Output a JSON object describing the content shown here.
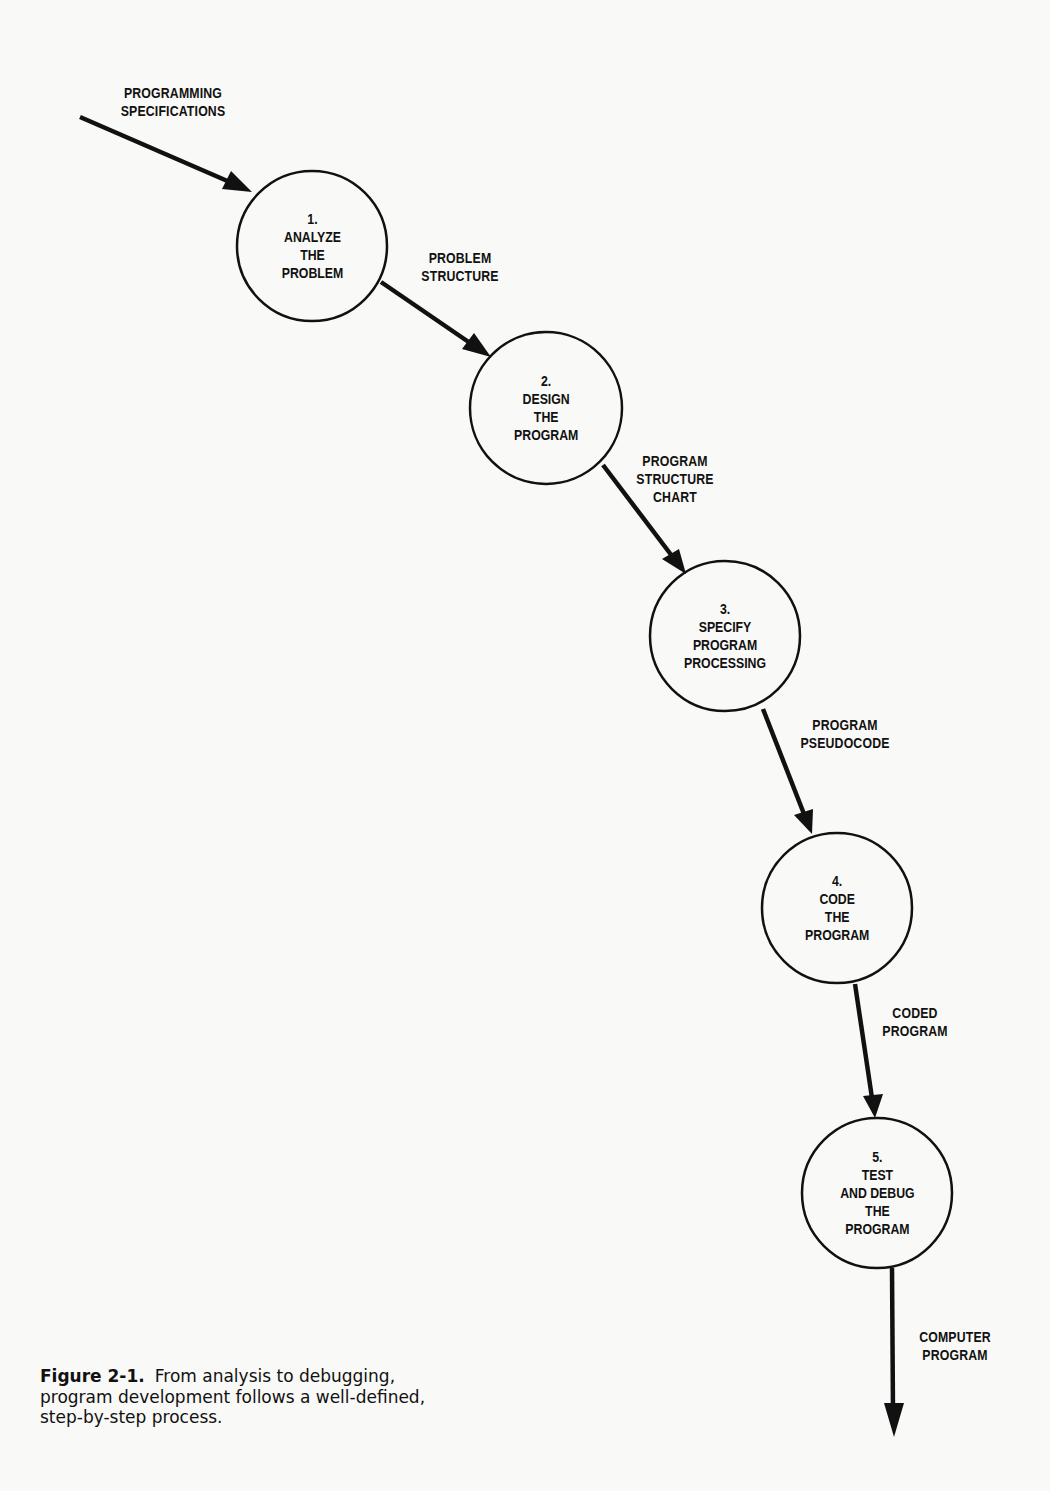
{
  "figure": {
    "number": "Figure 2-1.",
    "caption_lines": [
      "From analysis to debugging,",
      "program development follows a well-defined,",
      "step-by-step process."
    ]
  },
  "colors": {
    "ink": "#111111",
    "paper": "#f9f9f7"
  },
  "input": {
    "label_lines": [
      "PROGRAMMING",
      "SPECIFICATIONS"
    ]
  },
  "steps": [
    {
      "number": "1.",
      "lines": [
        "ANALYZE",
        "THE",
        "PROBLEM"
      ]
    },
    {
      "number": "2.",
      "lines": [
        "DESIGN",
        "THE",
        "PROGRAM"
      ]
    },
    {
      "number": "3.",
      "lines": [
        "SPECIFY",
        "PROGRAM",
        "PROCESSING"
      ]
    },
    {
      "number": "4.",
      "lines": [
        "CODE",
        "THE",
        "PROGRAM"
      ]
    },
    {
      "number": "5.",
      "lines": [
        "TEST",
        "AND DEBUG",
        "THE",
        "PROGRAM"
      ]
    }
  ],
  "flows": [
    {
      "lines": [
        "PROBLEM",
        "STRUCTURE"
      ]
    },
    {
      "lines": [
        "PROGRAM",
        "STRUCTURE",
        "CHART"
      ]
    },
    {
      "lines": [
        "PROGRAM",
        "PSEUDOCODE"
      ]
    },
    {
      "lines": [
        "CODED",
        "PROGRAM"
      ]
    },
    {
      "lines": [
        "COMPUTER",
        "PROGRAM"
      ]
    }
  ]
}
